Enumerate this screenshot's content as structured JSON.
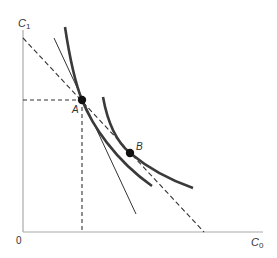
{
  "diagram": {
    "type": "intertemporal consumption diagram",
    "axes": {
      "y_label": "C",
      "y_label_subscript": "1",
      "x_label": "C",
      "x_label_subscript": "0",
      "origin_label": "0"
    },
    "points": [
      {
        "label": "A",
        "x": 82,
        "y": 100
      },
      {
        "label": "B",
        "x": 130,
        "y": 153
      }
    ],
    "colors": {
      "axis": "#aaaaaa",
      "curve": "#3a3a3a",
      "line": "#333333",
      "point": "#111111"
    }
  }
}
